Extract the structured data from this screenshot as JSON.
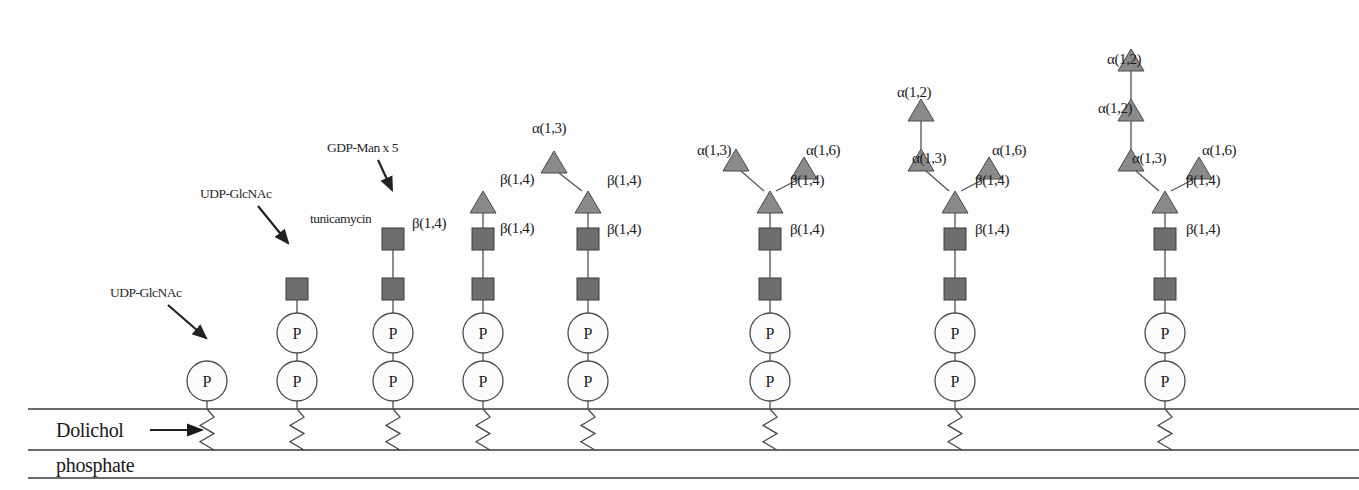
{
  "diagram": {
    "membrane": {
      "label_top": "Dolichol",
      "label_bottom": "phosphate",
      "arrow_name": "dolichol-arrow"
    },
    "annotations": [
      {
        "id": "ann-udp-glcnac-1",
        "text": "UDP-GlcNAc",
        "x": 110,
        "y": 297,
        "arrow": {
          "x1": 168,
          "y1": 305,
          "x2": 206,
          "y2": 338
        }
      },
      {
        "id": "ann-udp-glcnac-2",
        "text": "UDP-GlcNAc",
        "x": 200,
        "y": 198,
        "arrow": {
          "x1": 258,
          "y1": 206,
          "x2": 288,
          "y2": 243
        }
      },
      {
        "id": "ann-gdp-man",
        "text": "GDP-Man x 5",
        "x": 327,
        "y": 152,
        "arrow": {
          "x1": 378,
          "y1": 160,
          "x2": 392,
          "y2": 190
        }
      },
      {
        "id": "ann-tunicamycin",
        "text": "tunicamycin",
        "x": 310,
        "y": 223,
        "arrow": null
      }
    ],
    "colors": {
      "square_fill": "#6e6e6e",
      "triangle_fill": "#8a8a8a",
      "circle_fill": "#fbfbfb",
      "stroke": "#4a4a4a",
      "text": "#1c1c1c"
    },
    "symbol_legend": {
      "square": "GlcNAc",
      "triangle": "Mannose",
      "circle": "P (phosphate)"
    },
    "structures": [
      {
        "id": "structure-1",
        "x": 207,
        "phosphates": 1,
        "squares": 0,
        "triangles": 0,
        "linkage_labels": []
      },
      {
        "id": "structure-2",
        "x": 297,
        "phosphates": 2,
        "squares": 1,
        "triangles": 0,
        "linkage_labels": []
      },
      {
        "id": "structure-3",
        "x": 393,
        "phosphates": 2,
        "squares": 2,
        "triangles": 0,
        "linkage_labels": [
          {
            "text": "β(1,4)",
            "x": 412,
            "y": 228
          }
        ]
      },
      {
        "id": "structure-4",
        "x": 483,
        "phosphates": 2,
        "squares": 2,
        "triangles": 1,
        "linkage_labels": [
          {
            "text": "β(1,4)",
            "x": 500,
            "y": 184
          },
          {
            "text": "β(1,4)",
            "x": 500,
            "y": 233
          }
        ]
      },
      {
        "id": "structure-5",
        "x": 588,
        "phosphates": 2,
        "squares": 2,
        "triangles": 2,
        "linkage_labels": [
          {
            "text": "α(1,3)",
            "x": 532,
            "y": 133
          },
          {
            "text": "β(1,4)",
            "x": 607,
            "y": 185
          },
          {
            "text": "β(1,4)",
            "x": 607,
            "y": 234
          }
        ]
      },
      {
        "id": "structure-6",
        "x": 770,
        "phosphates": 2,
        "squares": 2,
        "triangles": 3,
        "linkage_labels": [
          {
            "text": "α(1,3)",
            "x": 697,
            "y": 155
          },
          {
            "text": "α(1,6)",
            "x": 806,
            "y": 155
          },
          {
            "text": "β(1,4)",
            "x": 790,
            "y": 185
          },
          {
            "text": "β(1,4)",
            "x": 790,
            "y": 234
          }
        ]
      },
      {
        "id": "structure-7",
        "x": 955,
        "phosphates": 2,
        "squares": 2,
        "triangles": 4,
        "linkage_labels": [
          {
            "text": "α(1,2)",
            "x": 897,
            "y": 97
          },
          {
            "text": "α(1,3)",
            "x": 912,
            "y": 163
          },
          {
            "text": "α(1,6)",
            "x": 992,
            "y": 155
          },
          {
            "text": "β(1,4)",
            "x": 975,
            "y": 185
          },
          {
            "text": "β(1,4)",
            "x": 975,
            "y": 234
          }
        ]
      },
      {
        "id": "structure-8",
        "x": 1165,
        "phosphates": 2,
        "squares": 2,
        "triangles": 5,
        "linkage_labels": [
          {
            "text": "α(1,2)",
            "x": 1107,
            "y": 64
          },
          {
            "text": "α(1,2)",
            "x": 1098,
            "y": 113
          },
          {
            "text": "α(1,3)",
            "x": 1132,
            "y": 163
          },
          {
            "text": "α(1,6)",
            "x": 1202,
            "y": 155
          },
          {
            "text": "β(1,4)",
            "x": 1186,
            "y": 185
          },
          {
            "text": "β(1,4)",
            "x": 1186,
            "y": 234
          }
        ]
      }
    ]
  }
}
